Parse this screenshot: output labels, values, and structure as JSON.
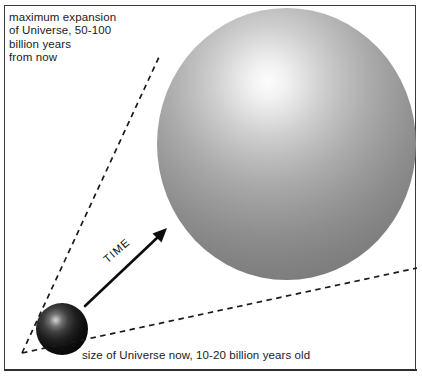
{
  "figure": {
    "background_color": "#ffffff",
    "frame_color": "#3a3a3a"
  },
  "labels": {
    "max_expansion": "maximum expansion\nof Universe, 50-100\nbillion years\nfrom now",
    "size_now": "size of Universe now, 10-20 billion years old",
    "time_axis": "TIME"
  },
  "objects": {
    "universe_now": {
      "name": "small-sphere",
      "description": "small dark sphere representing the Universe now",
      "center_x": 62,
      "center_y": 329,
      "radius": 26,
      "highlight_color": "#d8d8d8",
      "shadow_color": "#050505"
    },
    "universe_future": {
      "name": "large-sphere",
      "description": "large grey sphere representing the Universe at maximum expansion",
      "center_x": 286,
      "center_y": 144,
      "radius_x": 130,
      "radius_y": 136,
      "highlight_color": "#fcfcfc",
      "shadow_color": "#737373"
    }
  },
  "cone": {
    "apex_x": 22,
    "apex_y": 353,
    "upper_end_x": 159,
    "upper_end_y": 57,
    "lower_end_x": 417,
    "lower_end_y": 268,
    "style": "dashed",
    "color": "#1a1a1a"
  },
  "arrow": {
    "start_x": 85,
    "start_y": 306,
    "end_x": 166,
    "end_y": 229,
    "color": "#0d0d0d"
  }
}
